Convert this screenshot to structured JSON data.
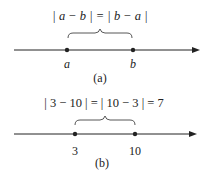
{
  "diagrams": [
    {
      "equation": "| a − b | = | b − a |",
      "point_labels": [
        "a",
        "b"
      ],
      "caption": "(a)",
      "points_x": [
        67,
        133
      ]
    },
    {
      "equation": "| 3 − 10 | = | 10 − 3 | = 7",
      "point_labels": [
        "3",
        "10"
      ],
      "caption": "(b)",
      "points_x": [
        75,
        135
      ]
    }
  ],
  "colors": {
    "line": "#222222",
    "text": "#333333"
  }
}
